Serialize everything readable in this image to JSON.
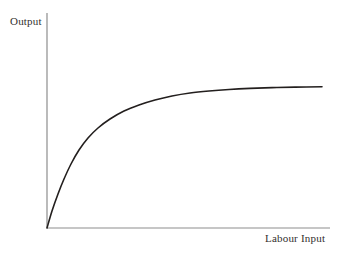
{
  "chart_data": {
    "type": "line",
    "title": "",
    "subtitle": "",
    "xlabel": "Labour Input",
    "ylabel": "Output",
    "grid": false,
    "legend": null,
    "legend_position": "none",
    "annotations": [],
    "xticks": [],
    "yticks": [],
    "xtick_labels": [],
    "ytick_labels": [],
    "xlim": [
      0,
      100
    ],
    "ylim": [
      0,
      100
    ],
    "series": [
      {
        "name": "Production function",
        "shape": "concave-increasing-asymptotic",
        "x": [
          0,
          5,
          10,
          15,
          20,
          25,
          30,
          35,
          40,
          45,
          50,
          55,
          60,
          65,
          70,
          75,
          80,
          85,
          90,
          95,
          100
        ],
        "y": [
          0,
          22.0,
          38.5,
          50.5,
          59.6,
          66.4,
          71.6,
          75.5,
          78.5,
          80.8,
          82.5,
          83.9,
          84.9,
          85.7,
          86.3,
          86.8,
          87.2,
          87.5,
          87.7,
          87.9,
          88.0
        ]
      }
    ]
  },
  "figure": {
    "background_color": "#ffffff",
    "curve_color": "#231f1e",
    "axis_color": "#8d8d8d",
    "text_color": "#332f2e",
    "curve_width": 1.6,
    "axis_width": 1.2
  },
  "axes": {
    "origin_px": [
      47,
      228
    ],
    "y_axis_top_px": [
      47,
      13
    ],
    "x_axis_right_px": [
      330,
      228
    ],
    "curve_points_px": [
      [
        47,
        228
      ],
      [
        52,
        211
      ],
      [
        58,
        194
      ],
      [
        64,
        179
      ],
      [
        71,
        164
      ],
      [
        79,
        150
      ],
      [
        88,
        138
      ],
      [
        98,
        128
      ],
      [
        110,
        119
      ],
      [
        124,
        111
      ],
      [
        139,
        105
      ],
      [
        155,
        100
      ],
      [
        172,
        96
      ],
      [
        190,
        93
      ],
      [
        209,
        91
      ],
      [
        229,
        89.5
      ],
      [
        250,
        88.4
      ],
      [
        272,
        87.6
      ],
      [
        295,
        87.1
      ],
      [
        322,
        86.8
      ]
    ]
  }
}
